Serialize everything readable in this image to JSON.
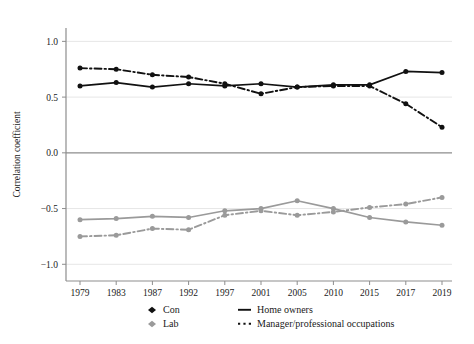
{
  "chart_data": {
    "type": "line",
    "title": "",
    "xlabel": "",
    "ylabel": "Correlation coefficient",
    "x": [
      1979,
      1983,
      1987,
      1992,
      1997,
      2001,
      2005,
      2010,
      2015,
      2017,
      2019
    ],
    "xtick_labels": [
      "1979",
      "1983",
      "1987",
      "1992",
      "1997",
      "2001",
      "2005",
      "2010",
      "2015",
      "2017",
      "2019"
    ],
    "ytick_labels": [
      "1.0",
      "0.5",
      "0.0",
      "−0.5",
      "−1.0"
    ],
    "ytick_values": [
      1.0,
      0.5,
      0.0,
      -0.5,
      -1.0
    ],
    "ylim": [
      -1.15,
      1.12
    ],
    "grid": "horizontal",
    "zero_line": true,
    "legend_position": "bottom",
    "series": [
      {
        "name": "Con – Home owners",
        "party": "Con",
        "measure": "Home owners",
        "color": "#111111",
        "style": "solid",
        "marker": "circle",
        "values": [
          0.6,
          0.63,
          0.59,
          0.62,
          0.6,
          0.62,
          0.59,
          0.61,
          0.61,
          0.73,
          0.72
        ]
      },
      {
        "name": "Con – Manager/professional occupations",
        "party": "Con",
        "measure": "Manager/professional occupations",
        "color": "#111111",
        "style": "dash-dot",
        "marker": "circle",
        "values": [
          0.76,
          0.75,
          0.7,
          0.68,
          0.62,
          0.53,
          0.59,
          0.6,
          0.6,
          0.44,
          0.23
        ]
      },
      {
        "name": "Lab – Home owners",
        "party": "Lab",
        "measure": "Home owners",
        "color": "#9a9a9a",
        "style": "solid",
        "marker": "circle",
        "values": [
          -0.6,
          -0.59,
          -0.57,
          -0.58,
          -0.52,
          -0.5,
          -0.43,
          -0.5,
          -0.58,
          -0.62,
          -0.65
        ]
      },
      {
        "name": "Lab – Manager/professional occupations",
        "party": "Lab",
        "measure": "Manager/professional occupations",
        "color": "#9a9a9a",
        "style": "dash-dot",
        "marker": "circle",
        "values": [
          -0.75,
          -0.74,
          -0.68,
          -0.69,
          -0.56,
          -0.52,
          -0.56,
          -0.53,
          -0.49,
          -0.46,
          -0.4
        ]
      }
    ],
    "legend": {
      "party_entries": [
        {
          "label": "Con",
          "color": "#111111",
          "marker": "diamond"
        },
        {
          "label": "Lab",
          "color": "#9a9a9a",
          "marker": "diamond"
        }
      ],
      "style_entries": [
        {
          "label": "Home owners",
          "style": "solid"
        },
        {
          "label": "Manager/professional occupations",
          "style": "dash-dot"
        }
      ]
    },
    "colors": {
      "con": "#111111",
      "lab": "#9a9a9a",
      "axis": "#8d8d8d",
      "grid": "#e6e6e6",
      "text": "#1a1a1a",
      "background": "#ffffff"
    }
  }
}
